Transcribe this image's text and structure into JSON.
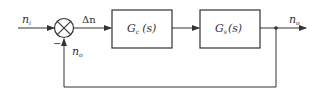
{
  "diagram": {
    "type": "feedback-control-block-diagram",
    "colors": {
      "line": "#333333",
      "background": "#ffffff"
    },
    "input": {
      "symbol": "n",
      "subscript": "i"
    },
    "error": {
      "symbol": "Δn"
    },
    "feedback_signal": {
      "symbol": "n",
      "subscript": "o"
    },
    "summing_junction": {
      "feedback_sign": "−"
    },
    "blocks": [
      {
        "id": "controller",
        "symbol": "G",
        "subscript": "c",
        "arg": "(s)"
      },
      {
        "id": "plant",
        "symbol": "G",
        "subscript": "s",
        "arg": "(s)"
      }
    ],
    "output": {
      "symbol": "n",
      "subscript": "o"
    }
  }
}
